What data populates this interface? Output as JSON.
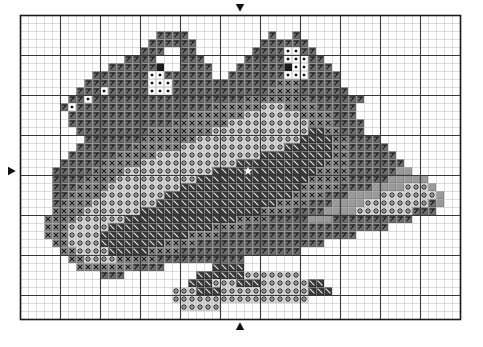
{
  "document": {
    "type": "cross-stitch-pattern-chart",
    "title": "Dragon Pair Cross Stitch Chart",
    "width_px": 483,
    "height_px": 347
  },
  "grid": {
    "origin_x": 20,
    "origin_y": 15,
    "cell_size": 8,
    "columns": 55,
    "rows": 38,
    "minor_line_color": "#b9b9b9",
    "major_line_color": "#3a3a3a",
    "border_color": "#1a1a1a",
    "major_every": 5,
    "background": "#ffffff"
  },
  "markers": [
    {
      "name": "top-center-arrow",
      "direction": "down",
      "col": 27,
      "edge": "top",
      "color": "#111111"
    },
    {
      "name": "bottom-center-arrow",
      "direction": "up",
      "col": 27,
      "edge": "bottom",
      "color": "#111111"
    },
    {
      "name": "left-center-arrow",
      "direction": "right",
      "row": 19,
      "edge": "left",
      "color": "#111111"
    },
    {
      "name": "center-star",
      "symbol": "star",
      "col": 28,
      "row": 19,
      "color": "#ffffff"
    }
  ],
  "palette": {
    "black": "#1c1c1c",
    "dark_gray": "#4a4a4a",
    "mid_gray": "#7d7d7d",
    "light_gray": "#b5b5b5",
    "pale_gray": "#d8d8d8",
    "white": "#ffffff",
    "symbol_ink": "#111111",
    "symbol_light": "#f2f2f2"
  },
  "symbol_legend": [
    {
      "key": "7",
      "name": "seven-slash",
      "fill": "#6e6e6e",
      "ink": "#101010",
      "glyph": "7"
    },
    {
      "key": "x",
      "name": "cross-x",
      "fill": "#8a8a8a",
      "ink": "#101010",
      "glyph": "x"
    },
    {
      "key": "o",
      "name": "circle-flower",
      "fill": "#e6e6e6",
      "ink": "#101010",
      "glyph": "o"
    },
    {
      "key": "b",
      "name": "backslash",
      "fill": "#3a3a3a",
      "ink": "#f0f0f0",
      "glyph": "\\"
    },
    {
      "key": "k",
      "name": "solid-black",
      "fill": "#1c1c1c",
      "ink": "#1c1c1c",
      "glyph": ""
    },
    {
      "key": "d",
      "name": "dot-cell",
      "fill": "#ffffff",
      "ink": "#101010",
      "glyph": "."
    },
    {
      "key": "g",
      "name": "plain-gray",
      "fill": "#9a9a9a",
      "ink": "#101010",
      "glyph": ""
    },
    {
      "key": ".",
      "name": "empty-cell",
      "fill": "#ffffff",
      "ink": "#ffffff",
      "glyph": ""
    }
  ],
  "chart_data": {
    "type": "grid",
    "columns": 55,
    "rows": 38,
    "legend_keys": [
      "7",
      "x",
      "o",
      "b",
      "k",
      "d",
      "g",
      "."
    ],
    "cells": [
      ".......................................................",
      ".......................................................",
      ".................7777..........7..7....................",
      "................777777........777777...................",
      "...............777..77.......7777dd77..................",
      ".............7777...777.....77777ddd77.................",
      "...........777777k..7777...777777kdd777................",
      ".........7777777dd777777..7777777ddd7777...............",
      "........77777777ddd7777777777777xxx77777...............",
      ".......777d77777ddd777777777777xxxx777777..............",
      "......77d7777777777777777777xxxxxxxx7777777............",
      ".....7d77777777777777777xxxxxxoooxxxx77777.............",
      "......777777777777777xxxxxxxoooooooxxxx777.............",
      "......7777777777777xxxxxxxooooooooooxxx7777............",
      ".......777777777xxxxxxxxoooooooooooobbxx777............",
      "........7777777xxxxxxxooooooooooooobbbbxx7777..........",
      ".......7777777xxxxxxooooooooooooobbbbbbxx77777.........",
      "......777777xxxxxooooooooooooo*bbbbbbbbxx777777........",
      ".....77777xxxxxoooooooooooobbbbbbbbbbbxxx7777777.......",
      "....77777xxxxooooooooooobbbbbbbbbbbbbxxxx777777gg......",
      "....7777xxxxoooooooooobbbbbbbbbbbbbbxxxxx77777ggggg....",
      "....777xxxxooooooooobbbbbbbbbbbbbbbxxxxx7777ggggooog...",
      "....77xxxxoooooooobbbbbbbbbbbbbbbbxxxx777ggggooooooog..",
      "....7xxxxoooooooobbbbbbbbbbbbbbbxxxx777ggggoooooooo7g..",
      "....xxxxooooooobbbbbbbbbbbbbbbxxxx7777ggggooooooo777...",
      "...xxxxoooooobbbbbbbbbbbbbbxxxx77777ggg7777777777.....",
      "...xxxooooobbbbbbbbbbbbbxxxx777777777777777777........",
      "...xxxoooobbbbbbbbbbbxxxx77777777777777777............",
      "....xxoooobbbbbbbbxxxx7777777777777777................",
      ".....xxoooobbbbbxxxx777777777777777...................",
      "......xxooooxxxxx77777777777..........................",
      ".......xxxxxxx7777......bbbb..........................",
      "..........777.........bbbbbbooooooo...................",
      ".....................bbbooobbboooooobb................",
      "...................ooobbbooooooooooobbb...............",
      "...................ooooooooooooooooo..................",
      "....................ooooo.............................",
      "......................................................."
    ]
  }
}
